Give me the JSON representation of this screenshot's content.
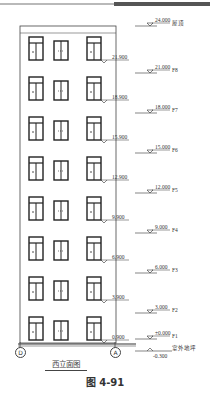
{
  "drawing": {
    "title": "西立面图",
    "figure_caption": "图 4-91",
    "axes": [
      {
        "label": "D",
        "x": 20
      },
      {
        "label": "A",
        "x": 115
      }
    ],
    "roof": {
      "elevation": "24.000",
      "label": "屋顶"
    },
    "floor_levels": [
      {
        "elevation": "21.000",
        "label": "F8"
      },
      {
        "elevation": "18.000",
        "label": "F7"
      },
      {
        "elevation": "15.000",
        "label": "F6"
      },
      {
        "elevation": "12.000",
        "label": "F5"
      },
      {
        "elevation": "9.000",
        "label": "F4"
      },
      {
        "elevation": "6.000",
        "label": "F3"
      },
      {
        "elevation": "3.000",
        "label": "F2"
      },
      {
        "elevation": "±0.000",
        "label": "F1"
      }
    ],
    "sill_levels": [
      "21.900",
      "18.900",
      "15.900",
      "12.900",
      "9.900",
      "6.900",
      "3.900",
      "0.900"
    ],
    "ground": {
      "elevation": "-0.300",
      "label": "室外地坪"
    }
  }
}
